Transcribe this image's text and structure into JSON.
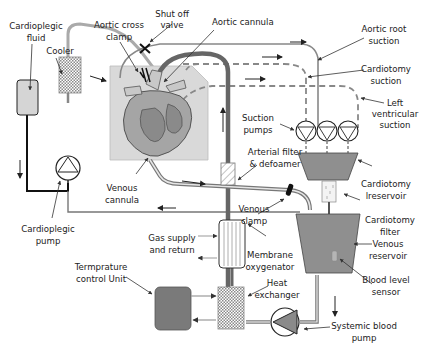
{
  "diagram": {
    "colors": {
      "tube_gray": "#8c8c8c",
      "tube_dark": "#6e6e6e",
      "tube_black": "#111111",
      "reservoir_fill": "#8f8f8f",
      "heart_box_fill": "#d9d9d9",
      "heart_fill": "#9a9a9a",
      "tcu_fill": "#7a7a7a",
      "arrow": "#222222"
    },
    "labels": {
      "cardioplegic_fluid": [
        "Cardioplegic",
        "fluid"
      ],
      "cooler": [
        "Cooler"
      ],
      "aortic_cross_clamp": [
        "Aortic cross",
        "clamp"
      ],
      "shut_off_valve": [
        "Shut off",
        "valve"
      ],
      "aortic_cannula": [
        "Aortic cannula"
      ],
      "aortic_root_suction": [
        "Aortic root",
        "suction"
      ],
      "cardiotomy_suction": [
        "Cardiotomy",
        "suction"
      ],
      "left_ventricular_suction": [
        "Left",
        "ventricular",
        "suction"
      ],
      "suction_pumps": [
        "Suction",
        "pumps"
      ],
      "arterial_filter": [
        "Arterial filter",
        "& defoamer"
      ],
      "cardiotomy_reservoir": [
        "Cardiotomy",
        "lreservoir"
      ],
      "venous_cannula": [
        "Venous",
        "cannula"
      ],
      "venous_clamp": [
        "Venous",
        "clamp"
      ],
      "cardiotomy_filter": [
        "Cardiotomy",
        "filter"
      ],
      "venous_reservoir": [
        "Venous",
        "reservoir"
      ],
      "blood_level_sensor": [
        "Blood level",
        "sensor"
      ],
      "cardioplegic_pump": [
        "Cardioplegic",
        "pump"
      ],
      "gas_supply": [
        "Gas supply",
        "and return"
      ],
      "membrane_oxygenator": [
        "Membrane",
        "oxygenator"
      ],
      "temperature_control": [
        "Termprature",
        "control Unit"
      ],
      "heat_exchanger": [
        "Heat",
        "exchanger"
      ],
      "systemic_pump": [
        "Systemic blood",
        "pump"
      ]
    },
    "components": [
      {
        "id": "cardioplegic-fluid-bag",
        "icon": "fluid-bag-icon"
      },
      {
        "id": "cooler",
        "icon": "cooler-icon"
      },
      {
        "id": "cardioplegic-pump",
        "icon": "pump-icon"
      },
      {
        "id": "heart",
        "icon": "heart-icon"
      },
      {
        "id": "aortic-cross-clamp",
        "icon": "clamp-icon"
      },
      {
        "id": "shut-off-valve",
        "icon": "valve-x-icon"
      },
      {
        "id": "suction-pump-1",
        "icon": "pump-icon"
      },
      {
        "id": "suction-pump-2",
        "icon": "pump-icon"
      },
      {
        "id": "suction-pump-3",
        "icon": "pump-icon"
      },
      {
        "id": "cardiotomy-reservoir",
        "icon": "reservoir-icon"
      },
      {
        "id": "cardiotomy-filter",
        "icon": "filter-icon"
      },
      {
        "id": "venous-reservoir",
        "icon": "reservoir-icon"
      },
      {
        "id": "blood-level-sensor",
        "icon": "sensor-icon"
      },
      {
        "id": "arterial-filter",
        "icon": "filter-icon"
      },
      {
        "id": "venous-clamp",
        "icon": "clamp-icon"
      },
      {
        "id": "membrane-oxygenator",
        "icon": "oxygenator-icon"
      },
      {
        "id": "heat-exchanger",
        "icon": "heat-exchanger-icon"
      },
      {
        "id": "temperature-control-unit",
        "icon": "tcu-icon"
      },
      {
        "id": "systemic-blood-pump",
        "icon": "pump-icon"
      }
    ]
  }
}
